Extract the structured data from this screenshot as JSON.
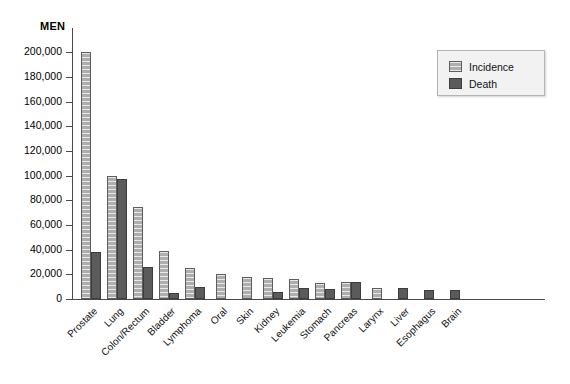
{
  "chart_data": {
    "type": "bar",
    "title": "MEN",
    "xlabel": "",
    "ylabel": "",
    "ylim": [
      0,
      210000
    ],
    "ytick_values": [
      0,
      20000,
      40000,
      60000,
      80000,
      100000,
      120000,
      140000,
      160000,
      180000,
      200000
    ],
    "ytick_labels": [
      "0",
      "20,000",
      "40,000",
      "60,000",
      "80,000",
      "100,000",
      "120,000",
      "140,000",
      "160,000",
      "180,000",
      "200,000"
    ],
    "grid": false,
    "legend_position": "top-right",
    "categories": [
      "Prostate",
      "Lung",
      "Colon/Rectum",
      "Bladder",
      "Lymphoma",
      "Oral",
      "Skin",
      "Kidney",
      "Leukemia",
      "Stomach",
      "Pancreas",
      "Larynx",
      "Liver",
      "Esophagus",
      "Brain"
    ],
    "series": [
      {
        "name": "Incidence",
        "color": "#aeaeae",
        "values": [
          200000,
          100000,
          75000,
          39000,
          25000,
          20000,
          18000,
          17000,
          16000,
          13000,
          14000,
          9000,
          0,
          0,
          0
        ]
      },
      {
        "name": "Death",
        "color": "#5b5b5b",
        "values": [
          38000,
          97000,
          26000,
          5000,
          10000,
          0,
          0,
          6000,
          9000,
          8000,
          14000,
          0,
          9000,
          7000,
          7000
        ]
      }
    ]
  },
  "legend": {
    "items": [
      {
        "label": "Incidence",
        "swatch": "incidence-swatch"
      },
      {
        "label": "Death",
        "swatch": "death-swatch"
      }
    ]
  }
}
